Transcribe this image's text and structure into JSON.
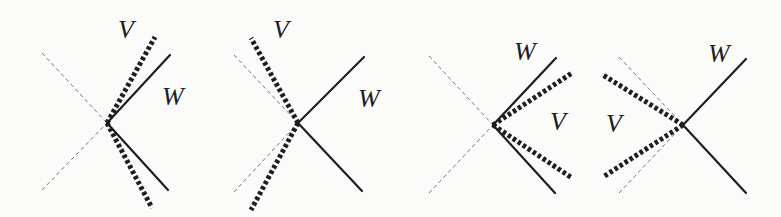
{
  "figure": {
    "panels": [
      {
        "id": "p1",
        "vertex": [
          107,
          123
        ],
        "guide": [
          [
            42,
            53
          ],
          [
            42,
            190
          ]
        ],
        "W": {
          "label": "W",
          "ends": [
            [
              170,
              55
            ],
            [
              168,
              190
            ]
          ],
          "label_pos": [
            162,
            105
          ]
        },
        "V": {
          "label": "V",
          "ends": [
            [
              155,
              37
            ],
            [
              152,
              208
            ]
          ],
          "label_pos": [
            118,
            38
          ]
        }
      },
      {
        "id": "p2",
        "vertex": [
          298,
          123
        ],
        "guide": [
          [
            234,
            55
          ],
          [
            234,
            192
          ]
        ],
        "W": {
          "label": "W",
          "ends": [
            [
              364,
              57
            ],
            [
              362,
              191
            ]
          ],
          "label_pos": [
            358,
            107
          ]
        },
        "V": {
          "label": "V",
          "ends": [
            [
              251,
              38
            ],
            [
              251,
              210
            ]
          ],
          "label_pos": [
            273,
            38
          ]
        }
      },
      {
        "id": "p3",
        "vertex": [
          493,
          125
        ],
        "guide": [
          [
            429,
            56
          ],
          [
            429,
            193
          ]
        ],
        "W": {
          "label": "W",
          "ends": [
            [
              556,
              58
            ],
            [
              555,
              193
            ]
          ],
          "label_pos": [
            514,
            60
          ]
        },
        "V": {
          "label": "V",
          "ends": [
            [
              572,
              73
            ],
            [
              572,
              178
            ]
          ],
          "label_pos": [
            550,
            130
          ]
        }
      },
      {
        "id": "p4",
        "vertex": [
          683,
          125
        ],
        "guide": [
          [
            619,
            57
          ],
          [
            619,
            193
          ]
        ],
        "W": {
          "label": "W",
          "ends": [
            [
              746,
              59
            ],
            [
              746,
              193
            ]
          ],
          "label_pos": [
            708,
            62
          ]
        },
        "V": {
          "label": "V",
          "ends": [
            [
              603,
              75
            ],
            [
              603,
              177
            ]
          ],
          "label_pos": [
            606,
            132
          ]
        }
      }
    ],
    "colors": {
      "ink": "#1e1e1e",
      "guide": "#777777",
      "bg": "#fbfbfa"
    }
  }
}
